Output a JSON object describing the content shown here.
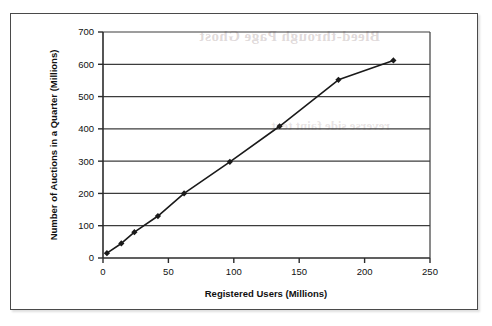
{
  "chart_data": {
    "type": "line",
    "title": "",
    "xlabel": "Registered Users (Millions)",
    "ylabel": "Number of Auctions in a Quarter (Millions)",
    "xlim": [
      0,
      250
    ],
    "ylim": [
      0,
      700
    ],
    "xticks": [
      0,
      50,
      100,
      150,
      200,
      250
    ],
    "yticks": [
      0,
      100,
      200,
      300,
      400,
      500,
      600,
      700
    ],
    "grid": "horizontal",
    "legend": "none",
    "marker": "filled-diamond",
    "line_color": "#1a1a1a",
    "series": [
      {
        "name": "Auctions vs Registered Users",
        "x": [
          3,
          14,
          24,
          42,
          62,
          97,
          135,
          180,
          222
        ],
        "y": [
          15,
          45,
          80,
          130,
          200,
          298,
          408,
          552,
          612
        ]
      }
    ]
  },
  "axes": {
    "x_axis_title": "Registered Users (Millions)",
    "y_axis_title": "Number of Auctions in a Quarter (Millions)",
    "x_tick_labels": [
      "0",
      "50",
      "100",
      "150",
      "200",
      "250"
    ],
    "y_tick_labels": [
      "0",
      "100",
      "200",
      "300",
      "400",
      "500",
      "600",
      "700"
    ]
  },
  "artifacts": {
    "bleed_text_top": "Bleed-through Page Ghost",
    "bleed_text_mid": "reverse side faint text"
  },
  "colors": {
    "line": "#1a1a1a",
    "grid": "#3c3c3c",
    "axis": "#2b2b2b",
    "frame": "#4a4a4a",
    "background": "#ffffff"
  }
}
